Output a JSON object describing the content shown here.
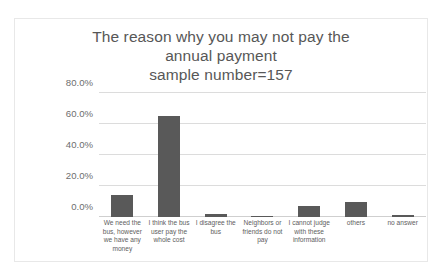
{
  "chart_data": {
    "type": "bar",
    "title": "The reason why you may not pay the annual payment\nsample number=157",
    "title_lines": [
      "The reason why you may not pay the",
      "annual payment",
      "sample number=157"
    ],
    "xlabel": "",
    "ylabel": "",
    "ylim": [
      0,
      80
    ],
    "grid": true,
    "legend": "none",
    "ytick_labels": [
      "0.0%",
      "20.0%",
      "40.0%",
      "60.0%",
      "80.0%"
    ],
    "ytick_values": [
      0,
      20,
      40,
      60,
      80
    ],
    "categories": [
      "We need the bus, however we have any money",
      "I think the bus user pay the whole cost",
      "I disagree the bus",
      "Neighbors or friends do not pay",
      "I cannot judge with these information",
      "others",
      "no answer"
    ],
    "values": [
      14.0,
      65.0,
      1.9,
      0.6,
      7.0,
      9.6,
      1.3
    ],
    "value_labels": [
      "14.0%",
      "65.0%",
      "1.9%",
      "0.6%",
      "7.0%",
      "9.6%",
      "1.3%"
    ],
    "series": [
      {
        "name": "percentage",
        "values": [
          14.0,
          65.0,
          1.9,
          0.6,
          7.0,
          9.6,
          1.3
        ]
      }
    ],
    "colors": {
      "bar": "#595959",
      "gridline": "#dcdcdc",
      "baseline": "#cfcfcf",
      "title_text": "#575757",
      "tick_text": "#6e6e6e",
      "label_text": "#5e5e5e",
      "frame_border": "#e8e8e8",
      "background": "#ffffff"
    }
  }
}
